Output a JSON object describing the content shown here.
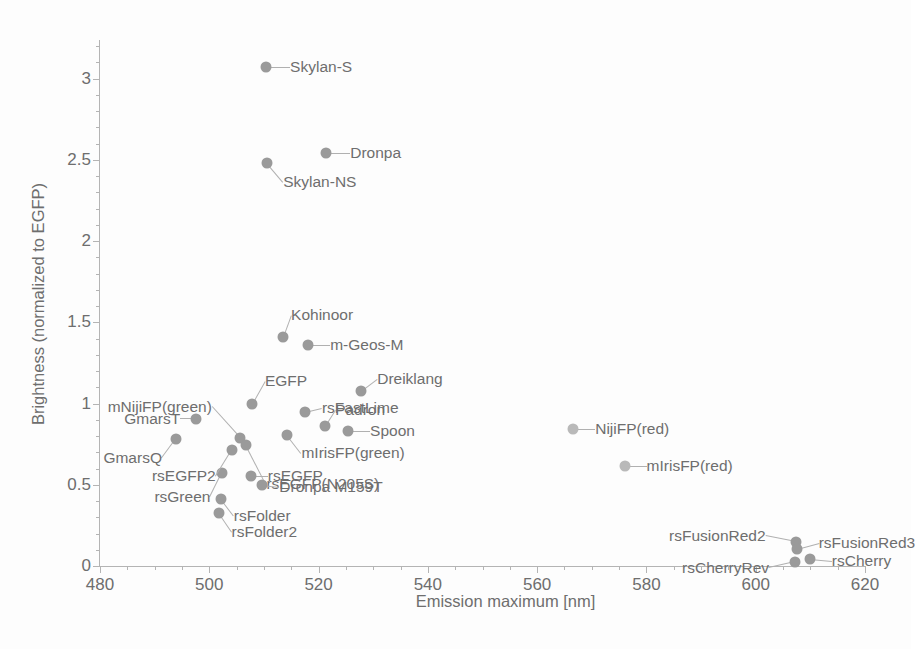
{
  "chart_data": {
    "type": "scatter",
    "title": "",
    "xlabel": "Emission maximum  [nm]",
    "ylabel": "Brightness (normalized to EGFP)",
    "xlim": [
      480,
      620
    ],
    "ylim": [
      0,
      3.2
    ],
    "xticks": [
      480,
      500,
      520,
      540,
      560,
      580,
      600,
      620
    ],
    "xtick_labels": [
      "480",
      "500",
      "520",
      "540",
      "560",
      "580",
      "600",
      "620"
    ],
    "x_minor_step": 5,
    "yticks": [
      0,
      0.5,
      1,
      1.5,
      2,
      2.5,
      3
    ],
    "ytick_labels": [
      "0",
      "0.5",
      "1",
      "1.5",
      "2",
      "2.5",
      "3"
    ],
    "y_minor_step": 0.1,
    "grid": false,
    "legend": "none",
    "marker_color": "#9a9a9a",
    "points": [
      {
        "label": "Skylan-S",
        "x": 510.4,
        "y": 3.07,
        "lx": 24,
        "ly": 0,
        "anchor": "left"
      },
      {
        "label": "Dronpa",
        "x": 521.4,
        "y": 2.54,
        "lx": 24,
        "ly": 0,
        "anchor": "left"
      },
      {
        "label": "Skylan-NS",
        "x": 510.6,
        "y": 2.48,
        "lx": 16,
        "ly": 19,
        "anchor": "left"
      },
      {
        "label": "Kohinoor",
        "x": 513.5,
        "y": 1.41,
        "lx": 8,
        "ly": -22,
        "anchor": "left"
      },
      {
        "label": "m-Geos-M",
        "x": 518.1,
        "y": 1.36,
        "lx": 22,
        "ly": 0,
        "anchor": "left"
      },
      {
        "label": "Dreiklang",
        "x": 527.8,
        "y": 1.075,
        "lx": 16,
        "ly": -12,
        "anchor": "left"
      },
      {
        "label": "EGFP",
        "x": 507.8,
        "y": 1.0,
        "lx": 13,
        "ly": -23,
        "anchor": "left"
      },
      {
        "label": "rsFastLime",
        "x": 517.5,
        "y": 0.945,
        "lx": 17,
        "ly": -4,
        "anchor": "left"
      },
      {
        "label": "mNijiFP(green)",
        "x": 505.6,
        "y": 0.79,
        "lx": -28,
        "ly": -31,
        "anchor": "right"
      },
      {
        "label": "GmarsT",
        "x": 497.6,
        "y": 0.905,
        "lx": -16,
        "ly": 0,
        "anchor": "right"
      },
      {
        "label": "Padron",
        "x": 521.2,
        "y": 0.86,
        "lx": 10,
        "ly": -16,
        "anchor": "left"
      },
      {
        "label": "Spoon",
        "x": 525.4,
        "y": 0.83,
        "lx": 22,
        "ly": 0,
        "anchor": "left"
      },
      {
        "label": "GmarsQ",
        "x": 493.9,
        "y": 0.78,
        "lx": -14,
        "ly": 19,
        "anchor": "right"
      },
      {
        "label": "mIrisFP(green)",
        "x": 514.3,
        "y": 0.805,
        "lx": 14,
        "ly": 18,
        "anchor": "left"
      },
      {
        "label": "rsEGFP(N205S)",
        "x": 506.8,
        "y": 0.745,
        "lx": 20,
        "ly": 39,
        "anchor": "left"
      },
      {
        "label": "rsGreen",
        "x": 502.4,
        "y": 0.57,
        "lx": -12,
        "ly": 24,
        "anchor": "right"
      },
      {
        "label": "rsEGFP",
        "x": 507.6,
        "y": 0.555,
        "lx": 17,
        "ly": 0,
        "anchor": "left"
      },
      {
        "label": "rsEGFP2",
        "x": 504.1,
        "y": 0.715,
        "lx": -16,
        "ly": 26,
        "anchor": "right"
      },
      {
        "label": "Dronpa M159T",
        "x": 509.7,
        "y": 0.5,
        "lx": 17,
        "ly": 2,
        "anchor": "left"
      },
      {
        "label": "rsFolder",
        "x": 502.1,
        "y": 0.41,
        "lx": 13,
        "ly": 17,
        "anchor": "left"
      },
      {
        "label": "rsFolder2",
        "x": 501.7,
        "y": 0.325,
        "lx": 13,
        "ly": 19,
        "anchor": "left"
      },
      {
        "label": "NijiFP(red)",
        "x": 566.6,
        "y": 0.845,
        "lx": 22,
        "ly": 0,
        "anchor": "left"
      },
      {
        "label": "mIrisFP(red)",
        "x": 576.0,
        "y": 0.615,
        "lx": 22,
        "ly": 0,
        "anchor": "left"
      },
      {
        "label": "rsFusionRed2",
        "x": 607.3,
        "y": 0.145,
        "lx": -30,
        "ly": -6,
        "anchor": "right"
      },
      {
        "label": "rsFusionRed3",
        "x": 607.5,
        "y": 0.105,
        "lx": 22,
        "ly": -6,
        "anchor": "left"
      },
      {
        "label": "rsCherryRev",
        "x": 607.2,
        "y": 0.025,
        "lx": -26,
        "ly": 6,
        "anchor": "right"
      },
      {
        "label": "rsCherry",
        "x": 609.9,
        "y": 0.045,
        "lx": 22,
        "ly": 2,
        "anchor": "left"
      }
    ]
  }
}
